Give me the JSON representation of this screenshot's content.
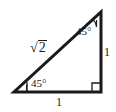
{
  "figure": {
    "kind": "geometry-diagram",
    "shape": "right-triangle",
    "background_color": "#ffffff",
    "stroke_color": "#1a1a1a",
    "text_color": "#1a1a1a"
  },
  "labels": {
    "hypotenuse_symbol": "√",
    "hypotenuse_radicand": "2",
    "hypotenuse_full": "√2",
    "angle_top": "45°",
    "angle_bottom_left": "45°",
    "side_right": "1",
    "side_bottom": "1"
  },
  "markers": {
    "right_angle": "right-angle-square",
    "angle_top_tick": "angle-tick",
    "angle_left_tick": "angle-tick"
  },
  "geometry": {
    "vertex_apex": {
      "x": 101,
      "y": 12
    },
    "vertex_bottom_left": {
      "x": 14,
      "y": 92
    },
    "vertex_bottom_right": {
      "x": 101,
      "y": 92
    },
    "stroke_width": 3
  }
}
